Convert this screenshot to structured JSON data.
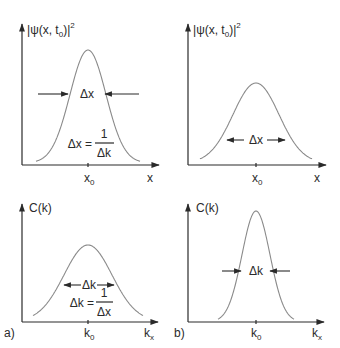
{
  "figure": {
    "panels": [
      {
        "id": "top-left",
        "ylabel": "|ψ(x,t₀)|²",
        "ylabel_parts": {
          "bar_open": "|",
          "psi": "ψ(x, t",
          "sub": "0",
          "close": ")",
          "bar_close": "|",
          "sup": "2"
        },
        "xlabel": "x",
        "tick_label": {
          "base": "x",
          "sub": "0"
        },
        "width_label": "Δx",
        "width_arrow_style": "outside-inward",
        "relation": {
          "lhs": "Δx =",
          "num": "1",
          "den": "Δk"
        },
        "curve": {
          "shape": "gaussian",
          "relative_height": 0.82,
          "relative_width": "wide"
        }
      },
      {
        "id": "top-right",
        "ylabel": "|ψ(x,t₀)|²",
        "ylabel_parts": {
          "bar_open": "|",
          "psi": "ψ(x, t",
          "sub": "0",
          "close": ")",
          "bar_close": "|",
          "sup": "2"
        },
        "xlabel": "x",
        "tick_label": {
          "base": "x",
          "sub": "0"
        },
        "width_label": "Δx",
        "width_arrow_style": "inside-outward",
        "curve": {
          "shape": "gaussian",
          "relative_height": 0.58,
          "relative_width": "wider"
        }
      },
      {
        "id": "bottom-left",
        "panel_tag": "a)",
        "ylabel": "C(k)",
        "xlabel": {
          "base": "k",
          "sub": "x"
        },
        "tick_label": {
          "base": "k",
          "sub": "0"
        },
        "width_label": "Δk",
        "width_arrow_style": "inside-outward",
        "relation": {
          "lhs": "Δk =",
          "num": "1",
          "den": "Δx"
        },
        "curve": {
          "shape": "gaussian",
          "relative_height": 0.62,
          "relative_width": "wide"
        }
      },
      {
        "id": "bottom-right",
        "panel_tag": "b)",
        "ylabel": "C(k)",
        "xlabel": {
          "base": "k",
          "sub": "x"
        },
        "tick_label": {
          "base": "k",
          "sub": "0"
        },
        "width_label": "Δk",
        "width_arrow_style": "outside-inward",
        "curve": {
          "shape": "gaussian",
          "relative_height": 0.9,
          "relative_width": "narrow"
        }
      }
    ]
  }
}
